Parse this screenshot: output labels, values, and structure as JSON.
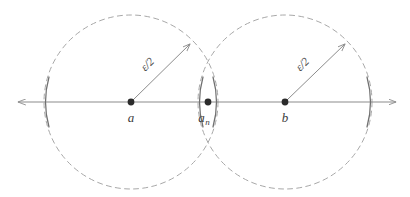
{
  "figure": {
    "type": "geometry-diagram",
    "background_color": "#ffffff",
    "colors": {
      "axis": "#8c8c8c",
      "circle_dashed": "#a8a8a8",
      "bracket_arc": "#707070",
      "point_fill": "#2b2b2b",
      "radius_arrow": "#8c8c8c",
      "text": "#3c3c3c"
    },
    "axis": {
      "name": "real-line",
      "y": 102,
      "x_start": 18,
      "x_end": 396,
      "left_arrow": true,
      "right_arrow": true
    },
    "circles": [
      {
        "id": "ball-a",
        "center_x": 131,
        "center_y": 102,
        "radius": 87,
        "style": "dashed",
        "label": "ε/2"
      },
      {
        "id": "ball-b",
        "center_x": 285,
        "center_y": 102,
        "radius": 87,
        "style": "dashed",
        "label": "ε/2"
      }
    ],
    "points": [
      {
        "id": "point-a",
        "label": "a",
        "sub": "",
        "x": 131,
        "y": 102,
        "label_x": 131,
        "label_y": 120
      },
      {
        "id": "point-an",
        "label": "a",
        "sub": "n",
        "x": 208,
        "y": 102,
        "label_x": 205,
        "label_y": 120
      },
      {
        "id": "point-b",
        "label": "b",
        "sub": "",
        "x": 285,
        "y": 102,
        "label_x": 285,
        "label_y": 120
      }
    ],
    "radius_arrows": [
      {
        "id": "radius-arrow-a",
        "from_x": 131,
        "from_y": 102,
        "to_x": 192,
        "to_y": 42,
        "label": "ε/2",
        "label_x": 152,
        "label_y": 64,
        "label_rotation": -45
      },
      {
        "id": "radius-arrow-b",
        "from_x": 285,
        "from_y": 102,
        "to_x": 347,
        "to_y": 42,
        "label": "ε/2",
        "label_x": 307,
        "label_y": 64,
        "label_rotation": -45
      }
    ],
    "bracket_arcs": [
      {
        "id": "arc-left-outer",
        "x": 44,
        "dir": "right"
      },
      {
        "id": "arc-lens-left",
        "x": 198,
        "dir": "right"
      },
      {
        "id": "arc-lens-right",
        "x": 218,
        "dir": "left"
      },
      {
        "id": "arc-right-outer",
        "x": 372,
        "dir": "left"
      }
    ]
  }
}
